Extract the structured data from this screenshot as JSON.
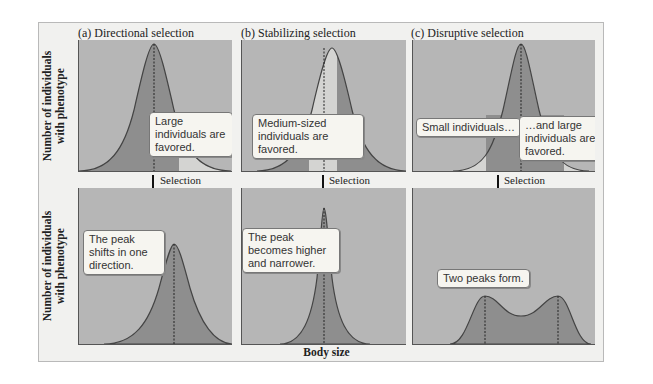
{
  "figure": {
    "ylabel": "Number of individuals with phenotype",
    "xlabel": "Body size",
    "arrow_label": "Selection",
    "panels": [
      {
        "id": "a",
        "title": "(a) Directional selection",
        "top_callout": "Large individuals are favored.",
        "bottom_callout": "The peak shifts in one direction."
      },
      {
        "id": "b",
        "title": "(b) Stabilizing selection",
        "top_callout": "Medium-sized individuals are favored.",
        "bottom_callout": "The peak becomes higher and narrower."
      },
      {
        "id": "c",
        "title": "(c) Disruptive selection",
        "top_callout_left": "Small individuals…",
        "top_callout_right": "…and large individuals are favored.",
        "bottom_callout": "Two peaks form."
      }
    ]
  },
  "colors": {
    "panel_bg": "#b6b6b6",
    "curve_fill": "#8e8e8e",
    "favored_fill": "#d4d4d2",
    "frame_bg": "#f1f1ef"
  }
}
